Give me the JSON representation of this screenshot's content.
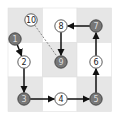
{
  "diagram": {
    "type": "grid-path",
    "grid": {
      "rows": 3,
      "cols": 3,
      "x": 8,
      "y": 8,
      "cell": 34.5,
      "shaded_color": "#e6e6e6",
      "white_color": "#ffffff",
      "border_color": "#e0e0e0",
      "cells": [
        {
          "row": 0,
          "col": 0,
          "shaded": true
        },
        {
          "row": 0,
          "col": 1,
          "shaded": false
        },
        {
          "row": 0,
          "col": 2,
          "shaded": true
        },
        {
          "row": 1,
          "col": 0,
          "shaded": false
        },
        {
          "row": 1,
          "col": 1,
          "shaded": true
        },
        {
          "row": 1,
          "col": 2,
          "shaded": false
        },
        {
          "row": 2,
          "col": 0,
          "shaded": true
        },
        {
          "row": 2,
          "col": 1,
          "shaded": false
        },
        {
          "row": 2,
          "col": 2,
          "shaded": true
        }
      ]
    },
    "colors": {
      "filled_node": "#777777",
      "filled_text": "#dddddd",
      "open_node": "#ffffff",
      "open_text": "#222222",
      "edge": "#111111",
      "dashed_edge": "#888888"
    },
    "nodes": [
      {
        "id": "1",
        "label": "1",
        "x": 15,
        "y": 39,
        "filled": true
      },
      {
        "id": "2",
        "label": "2",
        "x": 24,
        "y": 62,
        "filled": false
      },
      {
        "id": "3",
        "label": "3",
        "x": 24,
        "y": 99,
        "filled": true
      },
      {
        "id": "4",
        "label": "4",
        "x": 61,
        "y": 99,
        "filled": false
      },
      {
        "id": "5",
        "label": "5",
        "x": 96,
        "y": 99,
        "filled": true
      },
      {
        "id": "6",
        "label": "6",
        "x": 96,
        "y": 62,
        "filled": false
      },
      {
        "id": "7",
        "label": "7",
        "x": 96,
        "y": 26,
        "filled": true
      },
      {
        "id": "8",
        "label": "8",
        "x": 61,
        "y": 26,
        "filled": false
      },
      {
        "id": "9",
        "label": "9",
        "x": 61,
        "y": 62,
        "filled": true
      },
      {
        "id": "10",
        "label": "10",
        "x": 31,
        "y": 20,
        "filled": false
      }
    ],
    "edges": [
      {
        "from": "1",
        "to": "2",
        "style": "solid"
      },
      {
        "from": "2",
        "to": "3",
        "style": "solid"
      },
      {
        "from": "3",
        "to": "4",
        "style": "solid"
      },
      {
        "from": "4",
        "to": "5",
        "style": "solid"
      },
      {
        "from": "5",
        "to": "6",
        "style": "solid"
      },
      {
        "from": "6",
        "to": "7",
        "style": "solid"
      },
      {
        "from": "7",
        "to": "8",
        "style": "solid"
      },
      {
        "from": "8",
        "to": "9",
        "style": "solid"
      },
      {
        "from": "10",
        "to": "9",
        "style": "dashed"
      }
    ]
  }
}
